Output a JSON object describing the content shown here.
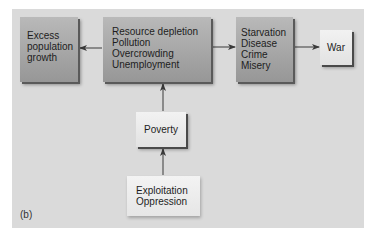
{
  "figure": {
    "panel_label": "(b)",
    "nodes": [
      {
        "id": "excess",
        "lines": [
          "Excess",
          "population",
          "growth"
        ]
      },
      {
        "id": "resource",
        "lines": [
          "Resource depletion",
          "Pollution",
          "Overcrowding",
          "Unemployment"
        ]
      },
      {
        "id": "starvation",
        "lines": [
          "Starvation",
          "Disease",
          "Crime",
          "Misery"
        ]
      },
      {
        "id": "war",
        "lines": [
          "War"
        ]
      },
      {
        "id": "poverty",
        "lines": [
          "Poverty"
        ]
      },
      {
        "id": "exploitation",
        "lines": [
          "Exploitation",
          "Oppression"
        ]
      }
    ],
    "edges": [
      {
        "from": "resource",
        "to": "excess"
      },
      {
        "from": "resource",
        "to": "starvation"
      },
      {
        "from": "starvation",
        "to": "war"
      },
      {
        "from": "poverty",
        "to": "resource"
      },
      {
        "from": "exploitation",
        "to": "poverty"
      }
    ],
    "colors": {
      "panel_bg": "#dadada",
      "dark_box": "#a6a6a6",
      "light_box": "#ececec",
      "arrow": "#3a3a3a"
    }
  }
}
